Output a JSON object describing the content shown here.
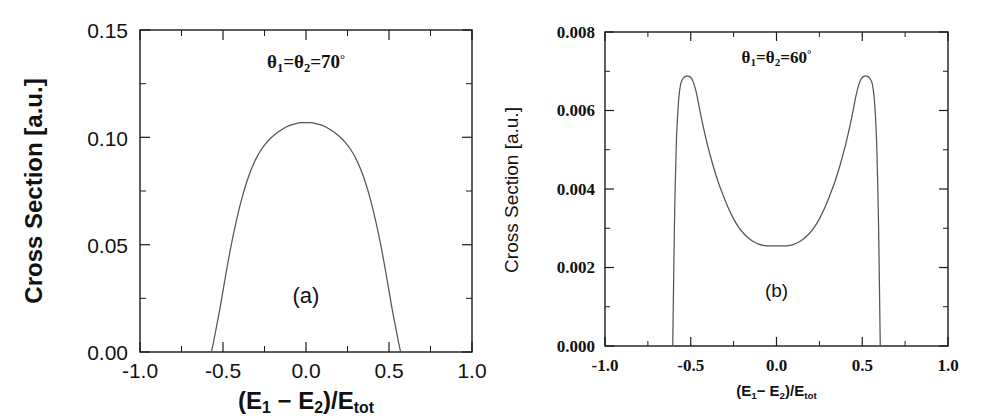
{
  "figure": {
    "background_color": "#ffffff",
    "curve_color": "#555555",
    "axis_color": "#1a1a1a"
  },
  "chart_data": [
    {
      "id": "panel-a",
      "type": "line",
      "title": "",
      "panel_label": "(a)",
      "annotation": "θ1=θ2=70°",
      "annotation_parts": {
        "theta": "θ",
        "sub1": "1",
        "eq1": "=",
        "sub2": "2",
        "eq2": "=",
        "value": "70",
        "degree": "°"
      },
      "xlabel": "(E1 − E2)/Etot",
      "ylabel": "Cross Section [a.u.]",
      "xlim": [
        -1.0,
        1.0
      ],
      "ylim": [
        0.0,
        0.15
      ],
      "xticks": [
        -1.0,
        -0.5,
        0.0,
        0.5,
        1.0
      ],
      "xticklabels": [
        "-1.0",
        "-0.5",
        "0.0",
        "0.5",
        "1.0"
      ],
      "yticks": [
        0.0,
        0.05,
        0.1,
        0.15
      ],
      "yticklabels": [
        "0.00",
        "0.05",
        "0.10",
        "0.15"
      ],
      "minor_xticks": [
        -0.75,
        -0.25,
        0.25,
        0.75
      ],
      "minor_yticks": [
        0.025,
        0.075,
        0.125
      ],
      "grid": false,
      "legend": "none",
      "x": [
        -0.57,
        -0.56,
        -0.55,
        -0.54,
        -0.53,
        -0.52,
        -0.5,
        -0.48,
        -0.45,
        -0.42,
        -0.39,
        -0.36,
        -0.33,
        -0.3,
        -0.27,
        -0.24,
        -0.21,
        -0.18,
        -0.15,
        -0.12,
        -0.09,
        -0.06,
        -0.03,
        0.0,
        0.03,
        0.06,
        0.09,
        0.12,
        0.15,
        0.18,
        0.21,
        0.24,
        0.27,
        0.3,
        0.33,
        0.36,
        0.39,
        0.42,
        0.45,
        0.48,
        0.5,
        0.52,
        0.53,
        0.54,
        0.55,
        0.56,
        0.57
      ],
      "y": [
        0.0,
        0.0035,
        0.0075,
        0.0115,
        0.0155,
        0.0195,
        0.0285,
        0.0375,
        0.05,
        0.061,
        0.0705,
        0.0785,
        0.085,
        0.0902,
        0.0942,
        0.0973,
        0.0998,
        0.1018,
        0.1034,
        0.1048,
        0.1058,
        0.1064,
        0.1068,
        0.1069,
        0.1068,
        0.1064,
        0.1058,
        0.1048,
        0.1034,
        0.1018,
        0.0998,
        0.0973,
        0.0942,
        0.0902,
        0.085,
        0.0785,
        0.0705,
        0.061,
        0.05,
        0.0375,
        0.0285,
        0.0195,
        0.0155,
        0.0115,
        0.0075,
        0.0035,
        0.0
      ],
      "peak_value": 0.107,
      "peak_x": 0.0,
      "x_cutoffs": [
        -0.57,
        0.57
      ]
    },
    {
      "id": "panel-b",
      "type": "line",
      "title": "",
      "panel_label": "(b)",
      "annotation": "θ1=θ2=60°",
      "annotation_parts": {
        "theta": "θ",
        "sub1": "1",
        "eq1": "=",
        "sub2": "2",
        "eq2": "=",
        "value": "60",
        "degree": "°"
      },
      "xlabel": "(E1 − E2)/Etot",
      "ylabel": "Cross Section [a.u.]",
      "xlim": [
        -1.0,
        1.0
      ],
      "ylim": [
        0.0,
        0.008
      ],
      "xticks": [
        -1.0,
        -0.5,
        0.0,
        0.5,
        1.0
      ],
      "xticklabels": [
        "-1.0",
        "-0.5",
        "0.0",
        "0.5",
        "1.0"
      ],
      "yticks": [
        0.0,
        0.002,
        0.004,
        0.006,
        0.008
      ],
      "yticklabels": [
        "0.000",
        "0.002",
        "0.004",
        "0.006",
        "0.008"
      ],
      "minor_xticks": [
        -0.75,
        -0.25,
        0.25,
        0.75
      ],
      "minor_yticks": [
        0.001,
        0.003,
        0.005,
        0.007
      ],
      "grid": false,
      "legend": "none",
      "x": [
        -0.605,
        -0.6,
        -0.595,
        -0.59,
        -0.585,
        -0.58,
        -0.57,
        -0.56,
        -0.55,
        -0.54,
        -0.53,
        -0.52,
        -0.51,
        -0.5,
        -0.49,
        -0.48,
        -0.47,
        -0.46,
        -0.44,
        -0.42,
        -0.4,
        -0.37,
        -0.34,
        -0.31,
        -0.28,
        -0.25,
        -0.22,
        -0.19,
        -0.16,
        -0.13,
        -0.1,
        -0.07,
        -0.04,
        0.0,
        0.04,
        0.07,
        0.1,
        0.13,
        0.16,
        0.19,
        0.22,
        0.25,
        0.28,
        0.31,
        0.34,
        0.37,
        0.4,
        0.42,
        0.44,
        0.46,
        0.47,
        0.48,
        0.49,
        0.5,
        0.51,
        0.52,
        0.53,
        0.54,
        0.55,
        0.56,
        0.57,
        0.58,
        0.585,
        0.59,
        0.595,
        0.6,
        0.605
      ],
      "y": [
        0.0,
        0.0016,
        0.0031,
        0.0042,
        0.005,
        0.0056,
        0.0063,
        0.00665,
        0.00678,
        0.00684,
        0.00687,
        0.00688,
        0.00687,
        0.00684,
        0.00677,
        0.00666,
        0.0065,
        0.0063,
        0.00585,
        0.00545,
        0.00508,
        0.0046,
        0.00418,
        0.00383,
        0.00351,
        0.00324,
        0.00302,
        0.00286,
        0.00274,
        0.00265,
        0.00259,
        0.00256,
        0.00255,
        0.00255,
        0.00255,
        0.00256,
        0.00259,
        0.00265,
        0.00274,
        0.00286,
        0.00302,
        0.00324,
        0.00351,
        0.00383,
        0.00418,
        0.0046,
        0.00508,
        0.00545,
        0.00585,
        0.0063,
        0.0065,
        0.00666,
        0.00677,
        0.00684,
        0.00687,
        0.00688,
        0.00687,
        0.00684,
        0.00678,
        0.00665,
        0.0063,
        0.0056,
        0.005,
        0.0042,
        0.0031,
        0.0016,
        0.0
      ],
      "peak_value": 0.00688,
      "peak_x": [
        -0.52,
        0.52
      ],
      "minimum_value": 0.00255,
      "minimum_x": 0.0,
      "x_cutoffs": [
        -0.605,
        0.605
      ]
    }
  ]
}
